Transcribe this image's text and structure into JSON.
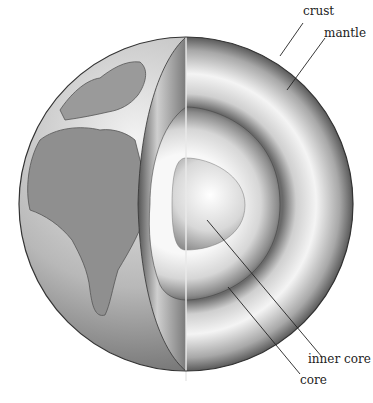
{
  "labels": {
    "crust": "crust",
    "mantle": "mantle",
    "inner_core": "inner core",
    "core": "core"
  },
  "colors": {
    "background": "#ffffff",
    "line": "#222222",
    "ocean": "#bdbdbd",
    "land": "#8f8f8f"
  }
}
